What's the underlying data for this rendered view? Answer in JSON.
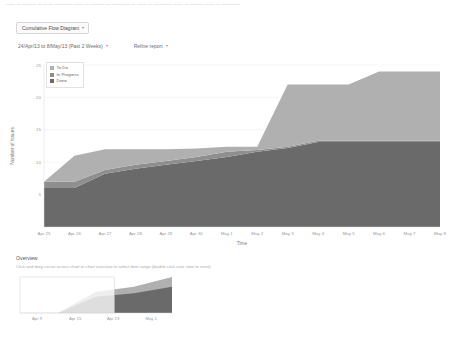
{
  "ghost_text": "—— — ——— — —— ———— —— — ——— — ———— — —— — ———— —— — ——— —— — ————",
  "controls": {
    "report_selector": "Cumulative Flow Diagram",
    "date_range": "24/Apr/13 to 8/May/13 (Past 2 Weeks)",
    "refine_report": "Refine report",
    "caret_icon": "▾"
  },
  "legend": {
    "items": [
      {
        "label": "To Do",
        "color": "#b0b0b0"
      },
      {
        "label": "In Progress",
        "color": "#8f8f8f"
      },
      {
        "label": "Done",
        "color": "#6a6a6a"
      }
    ],
    "swatch_icon": "legend-swatch-icon"
  },
  "overview": {
    "title": "Overview",
    "hint": "Click and drag cursor across chart or chart overview to select date range (double-click over view to reset)",
    "xticks": [
      "Apr 9",
      "Apr 15",
      "Apr 23",
      "May 1"
    ]
  },
  "chart_data": {
    "type": "area",
    "title": "Cumulative Flow Diagram",
    "xlabel": "Time",
    "ylabel": "Number of Issues",
    "ylim": [
      0,
      25
    ],
    "yticks": [
      5,
      10,
      15,
      20,
      25
    ],
    "grid": true,
    "legend_position": "top-left",
    "categories": [
      "Apr 25",
      "Apr 26",
      "Apr 27",
      "Apr 28",
      "Apr 29",
      "Apr 30",
      "May 1",
      "May 2",
      "May 3",
      "May 4",
      "May 5",
      "May 6",
      "May 7",
      "May 8"
    ],
    "series": [
      {
        "name": "Done",
        "color": "#6a6a6a",
        "values": [
          6.0,
          6.0,
          8.2,
          9.0,
          9.6,
          10.2,
          10.8,
          11.6,
          12.2,
          13.1,
          13.1,
          13.1,
          13.1,
          13.1
        ]
      },
      {
        "name": "In Progress",
        "color": "#8f8f8f",
        "values": [
          1.0,
          1.0,
          0.6,
          0.6,
          0.6,
          0.6,
          0.8,
          0.3,
          0.2,
          0.2,
          0.2,
          0.2,
          0.2,
          0.2
        ]
      },
      {
        "name": "To Do",
        "color": "#b0b0b0",
        "values": [
          0.0,
          4.0,
          3.2,
          2.4,
          1.8,
          1.3,
          0.8,
          0.5,
          9.6,
          8.7,
          8.7,
          10.7,
          10.7,
          10.7
        ]
      }
    ],
    "totals": [
      7.0,
      11.0,
      12.0,
      12.0,
      12.0,
      12.1,
      12.4,
      12.4,
      22.0,
      22.0,
      22.0,
      24.0,
      24.0,
      24.0
    ],
    "overview_chart": {
      "type": "area",
      "x": [
        "Apr 9",
        "Apr 15",
        "Apr 23",
        "May 1",
        "May 8"
      ],
      "done_values": [
        0.0,
        0.0,
        5.0,
        6.0,
        8.0
      ],
      "total_values": [
        0.0,
        0.0,
        6.5,
        8.0,
        11.0
      ],
      "selection": {
        "start_label": "Apr 9",
        "end_label": "Apr 28"
      }
    }
  }
}
